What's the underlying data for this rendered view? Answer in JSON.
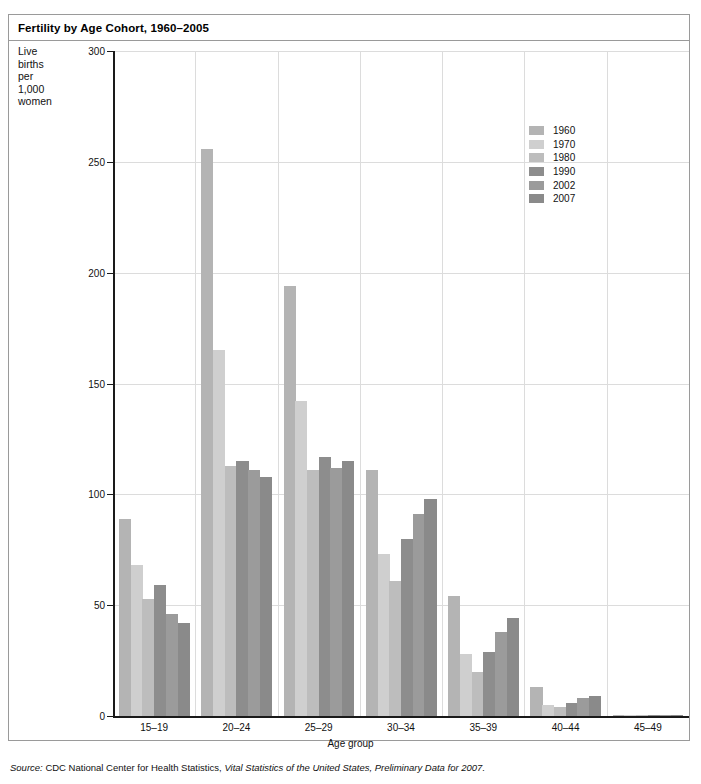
{
  "title": "Fertility by Age Cohort, 1960–2005",
  "axis": {
    "y_caption": "Live births per 1,000 women",
    "y_caption_lines": [
      "Live",
      "births",
      "per",
      "1,000",
      "women"
    ],
    "x_title": "Age group",
    "y_ticks": [
      "0",
      "50",
      "100",
      "150",
      "200",
      "250",
      "300"
    ]
  },
  "source": {
    "prefix": "Source:",
    "text": " CDC National Center for Health Statistics, ",
    "italic": "Vital Statistics of the United States, Preliminary Data for 2007."
  },
  "legend": {
    "entries": [
      {
        "label": "1960",
        "color": "#b4b4b4"
      },
      {
        "label": "1970",
        "color": "#cfcfcf"
      },
      {
        "label": "1980",
        "color": "#bdbdbd"
      },
      {
        "label": "1990",
        "color": "#8d8d8d"
      },
      {
        "label": "2002",
        "color": "#9b9b9b"
      },
      {
        "label": "2007",
        "color": "#8a8a8a"
      }
    ]
  },
  "chart_data": {
    "type": "bar",
    "title": "Fertility by Age Cohort, 1960–2005",
    "xlabel": "Age group",
    "ylabel": "Live births per 1,000 women",
    "ylim": [
      0,
      300
    ],
    "ytick_step": 50,
    "grid": true,
    "legend_position": "inside-top-right",
    "categories": [
      "15–19",
      "20–24",
      "25–29",
      "30–34",
      "35–39",
      "40–44",
      "45–49"
    ],
    "series": [
      {
        "name": "1960",
        "color": "#b4b4b4",
        "values": [
          89,
          256,
          194,
          111,
          54,
          13,
          0.5
        ]
      },
      {
        "name": "1970",
        "color": "#cfcfcf",
        "values": [
          68,
          165,
          142,
          73,
          28,
          5,
          0.3
        ]
      },
      {
        "name": "1980",
        "color": "#bdbdbd",
        "values": [
          53,
          113,
          111,
          61,
          20,
          4,
          0.2
        ]
      },
      {
        "name": "1990",
        "color": "#8d8d8d",
        "values": [
          59,
          115,
          117,
          80,
          29,
          6,
          0.2
        ]
      },
      {
        "name": "2002",
        "color": "#9b9b9b",
        "values": [
          46,
          111,
          112,
          91,
          38,
          8,
          0.5
        ]
      },
      {
        "name": "2007",
        "color": "#8a8a8a",
        "values": [
          42,
          108,
          115,
          98,
          44,
          9,
          0.6
        ]
      }
    ]
  }
}
